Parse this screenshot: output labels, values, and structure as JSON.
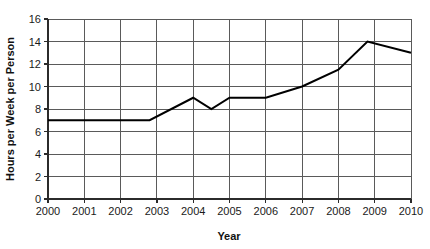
{
  "chart_data": {
    "type": "line",
    "title": "",
    "xlabel": "Year",
    "ylabel": "Hours per Week per Person",
    "xlim": [
      2000,
      2010
    ],
    "ylim": [
      0,
      16
    ],
    "grid": true,
    "legend": false,
    "legend_position": "none",
    "x_ticks": [
      "2000",
      "2001",
      "2002",
      "2003",
      "2004",
      "2005",
      "2006",
      "2007",
      "2008",
      "2009",
      "2010"
    ],
    "y_ticks": [
      "0",
      "2",
      "4",
      "6",
      "8",
      "10",
      "12",
      "14",
      "16"
    ],
    "series": [
      {
        "name": "Hours per Week per Person",
        "color": "#000000",
        "points": [
          {
            "x": 2000.0,
            "y": 7.0
          },
          {
            "x": 2002.8,
            "y": 7.0
          },
          {
            "x": 2004.0,
            "y": 9.0
          },
          {
            "x": 2004.5,
            "y": 8.0
          },
          {
            "x": 2005.0,
            "y": 9.0
          },
          {
            "x": 2006.0,
            "y": 9.0
          },
          {
            "x": 2007.0,
            "y": 10.0
          },
          {
            "x": 2008.0,
            "y": 11.5
          },
          {
            "x": 2008.8,
            "y": 14.0
          },
          {
            "x": 2010.0,
            "y": 13.0
          }
        ]
      }
    ]
  },
  "axes": {
    "x_title": "Year",
    "y_title": "Hours per Week per Person"
  }
}
